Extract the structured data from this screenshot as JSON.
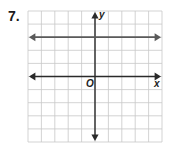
{
  "problem": {
    "number": "7."
  },
  "chart_data": {
    "type": "line",
    "title": "",
    "xlabel": "x",
    "ylabel": "y",
    "origin_label": "O",
    "grid": true,
    "xlim": [
      -5,
      5
    ],
    "ylim": [
      -5,
      5
    ],
    "grid_spacing": 1,
    "series": [
      {
        "name": "horizontal line",
        "equation": "y = 3",
        "x": [
          -5,
          5
        ],
        "y": [
          3,
          3
        ],
        "arrows_both_ends": true
      }
    ]
  },
  "colors": {
    "grid": "#c8c8c8",
    "axis": "#2a2a2a",
    "line": "#5a5a5a",
    "background": "#ffffff"
  }
}
